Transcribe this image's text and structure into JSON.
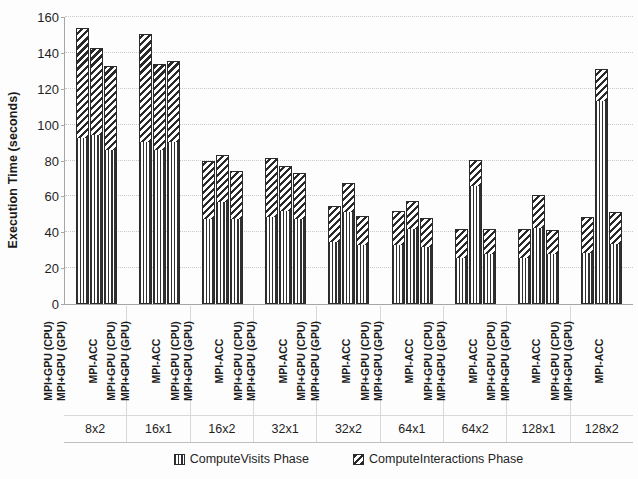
{
  "chart_data": {
    "type": "bar",
    "subtype": "stacked-grouped-bar",
    "title": "",
    "xlabel": "",
    "ylabel": "Execution Time (seconds)",
    "ylim": [
      0,
      160
    ],
    "ytick_step": 20,
    "ytick_labels": [
      "0",
      "20",
      "40",
      "60",
      "80",
      "100",
      "120",
      "140",
      "160"
    ],
    "grid": true,
    "legend_position": "bottom",
    "categories": [
      "8x2",
      "16x1",
      "16x2",
      "32x1",
      "32x2",
      "64x1",
      "64x2",
      "128x1",
      "128x2"
    ],
    "variants": [
      "MPI+GPU (CPU)",
      "MPI+GPU (GPU)",
      "MPI-ACC"
    ],
    "series": [
      {
        "name": "ComputeVisits Phase",
        "pattern": "vertical-stripes",
        "values": [
          [
            93,
            94.5,
            86.5
          ],
          [
            90.5,
            86,
            90.5
          ],
          [
            47.5,
            57,
            48
          ],
          [
            49,
            52,
            47.5
          ],
          [
            35,
            52,
            33
          ],
          [
            33,
            42,
            32
          ],
          [
            26,
            66.5,
            28
          ],
          [
            26,
            42.5,
            28
          ],
          [
            29,
            113.5,
            34
          ]
        ]
      },
      {
        "name": "ComputeInteractions Phase",
        "pattern": "diagonal-hatch",
        "values": [
          [
            61,
            48.5,
            46
          ],
          [
            60,
            48,
            45
          ],
          [
            32,
            26,
            26
          ],
          [
            32.5,
            25,
            25.5
          ],
          [
            19.5,
            15.5,
            16
          ],
          [
            19,
            15.5,
            16
          ],
          [
            16,
            14,
            14
          ],
          [
            16,
            18.5,
            13
          ],
          [
            19.5,
            17.5,
            17.5
          ]
        ]
      }
    ],
    "totals": [
      [
        154,
        143,
        132.5
      ],
      [
        150.5,
        134,
        135.5
      ],
      [
        79.5,
        83,
        74
      ],
      [
        81.5,
        77,
        73
      ],
      [
        54.5,
        67.5,
        49
      ],
      [
        52,
        57.5,
        48
      ],
      [
        42,
        80.5,
        42
      ],
      [
        42,
        61,
        41
      ],
      [
        48.5,
        131,
        51.5
      ]
    ]
  },
  "legend": {
    "items": [
      {
        "label": "ComputeVisits Phase"
      },
      {
        "label": "ComputeInteractions Phase"
      }
    ]
  },
  "colors": {
    "axis": "#a6a6a6",
    "grid": "#c9c9c9",
    "bar_outline": "#2b2b2b",
    "text": "#1f1f1f"
  }
}
